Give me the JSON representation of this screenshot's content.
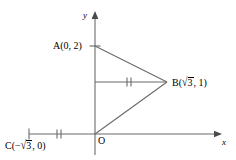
{
  "figure": {
    "type": "geometry-diagram",
    "background_color": "#ffffff",
    "line_color": "#555555",
    "text_color": "#000000",
    "axes": {
      "x_axis_label": "x",
      "y_axis_label": "y",
      "origin_label": "O"
    },
    "points": [
      {
        "name": "A",
        "label": "A(0, 2)",
        "coord_x": 0,
        "coord_y": 2
      },
      {
        "name": "B",
        "label_prefix": "B(",
        "label_radical": "3",
        "label_suffix": ", 1)",
        "coord_x": 1.732,
        "coord_y": 1
      },
      {
        "name": "C",
        "label_prefix": "C(−",
        "label_radical": "3",
        "label_suffix": ", 0)",
        "coord_x": -1.732,
        "coord_y": 0
      },
      {
        "name": "O",
        "label": "O",
        "coord_x": 0,
        "coord_y": 0
      }
    ],
    "segments": [
      {
        "name": "segment-a-b",
        "from": "A",
        "to": "B",
        "ticks": 0
      },
      {
        "name": "segment-b-o",
        "from": "B",
        "to": "O",
        "ticks": 0
      },
      {
        "name": "segment-midline",
        "from": "y-axis at y=1",
        "to": "B",
        "ticks": 2
      },
      {
        "name": "segment-c-o",
        "from": "C",
        "to": "O",
        "ticks": 2
      }
    ],
    "radical_glyph": "√"
  }
}
